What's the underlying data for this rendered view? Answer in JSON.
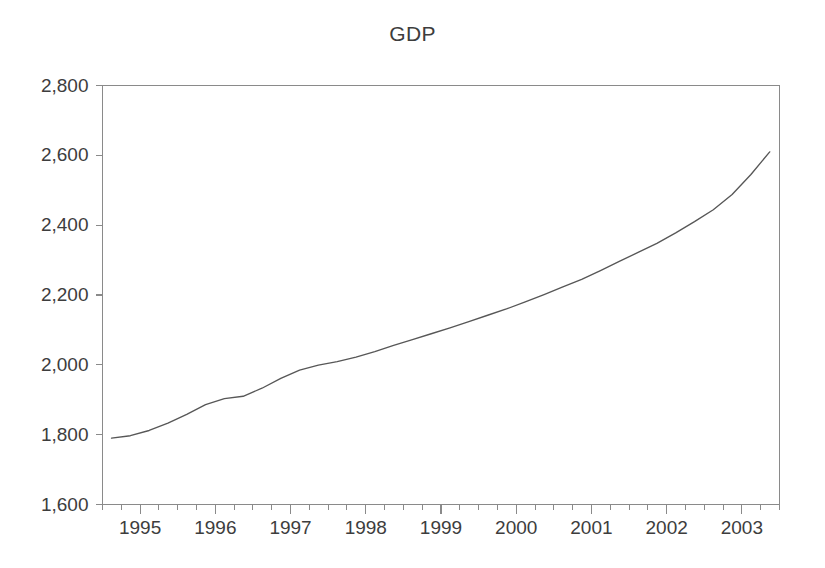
{
  "chart_data": {
    "type": "line",
    "title": "GDP",
    "xlabel": "",
    "ylabel": "",
    "grid": false,
    "legend": false,
    "legend_position": "none",
    "series_name": "GDP",
    "line_color": "#575757",
    "axis_color": "#8a8a8a",
    "background_color": "#ffffff",
    "ylim": [
      1600,
      2800
    ],
    "ytick_labels": [
      "2,800",
      "2,600",
      "2,400",
      "2,200",
      "2,000",
      "1,800",
      "1,600"
    ],
    "ytick_values": [
      2800,
      2600,
      2400,
      2200,
      2000,
      1800,
      1600
    ],
    "xtick_labels": [
      "1995",
      "1996",
      "1997",
      "1998",
      "1999",
      "2000",
      "2001",
      "2002",
      "2003"
    ],
    "xtick_values": [
      1995,
      1996,
      1997,
      1998,
      1999,
      2000,
      2001,
      2002,
      2003
    ],
    "xlim": [
      1994.5,
      2003.5
    ],
    "x_minor_tick_interval": 0.25,
    "x": [
      1994.62,
      1994.87,
      1995.12,
      1995.37,
      1995.62,
      1995.87,
      1996.12,
      1996.37,
      1996.62,
      1996.87,
      1997.12,
      1997.37,
      1997.62,
      1997.87,
      1998.12,
      1998.37,
      1998.62,
      1998.87,
      1999.12,
      1999.37,
      1999.62,
      1999.87,
      2000.12,
      2000.37,
      2000.62,
      2000.87,
      2001.12,
      2001.37,
      2001.62,
      2001.87,
      2002.12,
      2002.37,
      2002.62,
      2002.87,
      2003.12,
      2003.37
    ],
    "y": [
      1790,
      1797,
      1812,
      1833,
      1858,
      1886,
      1903,
      1910,
      1933,
      1961,
      1985,
      1999,
      2009,
      2022,
      2038,
      2056,
      2072,
      2089,
      2106,
      2124,
      2142,
      2160,
      2180,
      2201,
      2223,
      2245,
      2270,
      2296,
      2322,
      2348,
      2378,
      2410,
      2444,
      2488,
      2545,
      2610
    ],
    "values_summary": {
      "start_value": 1790,
      "end_value": 2610,
      "min_value": 1790,
      "max_value": 2610
    }
  }
}
